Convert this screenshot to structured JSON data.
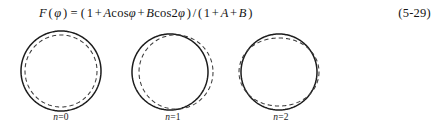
{
  "equation": {
    "function_name": "F",
    "argument": "φ",
    "full_text": "F(φ) = (1 + Acosφ + Bcos2φ)/(1 + A + B)",
    "lhs": "F(φ)",
    "rhs": "(1 + Acosφ + Bcos2φ)/(1 + A + B)",
    "number": "(5-29)",
    "tokens": {
      "F": "F",
      "open_paren": "(",
      "phi": "φ",
      "close_paren": ")",
      "equals": "=",
      "one": "1",
      "plus": "+",
      "A": "A",
      "cos": "cos",
      "B": "B",
      "two": "2",
      "slash": "/"
    }
  },
  "figures": [
    {
      "id": "fig-0",
      "caption": "n=0",
      "caption_var": "n",
      "caption_value": "=0",
      "mode": 0,
      "description": "solid circle with concentric dashed circle",
      "solid_color": "#1c1c1c",
      "dashed_color": "#3c3c3c",
      "center": [
        55,
        47
      ],
      "radius": 40,
      "dashed_radius": 36,
      "dashed_offset_x": 0,
      "amplitude": 0
    },
    {
      "id": "fig-1",
      "caption": "n=1",
      "caption_var": "n",
      "caption_value": "=1",
      "mode": 1,
      "description": "solid circle with dashed curve shifted right (cos phi perturbation)",
      "solid_color": "#1c1c1c",
      "dashed_color": "#3c3c3c",
      "center": [
        52,
        48
      ],
      "radius": 38,
      "dashed_radius": 37,
      "dashed_offset_x": 3,
      "amplitude": 3
    },
    {
      "id": "fig-2",
      "caption": "n=2",
      "caption_var": "n",
      "caption_value": "=2",
      "mode": 2,
      "description": "solid circle with dashed ellipse wider horizontally (cos 2phi perturbation)",
      "solid_color": "#1c1c1c",
      "dashed_color": "#3c3c3c",
      "center": [
        53,
        48
      ],
      "radius": 38,
      "dashed_radius": 37,
      "dashed_offset_x": 0,
      "amplitude": 3
    }
  ],
  "page": {
    "background": "#ffffff",
    "text_color": "#141414"
  }
}
